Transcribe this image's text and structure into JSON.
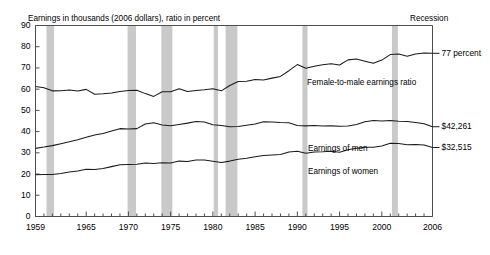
{
  "chart_data": {
    "type": "line",
    "title": "Earnings in thousands (2006 dollars), ratio in percent",
    "xlabel": "",
    "ylabel": "",
    "ylim": [
      0,
      90
    ],
    "xlim": [
      1959,
      2006
    ],
    "ytick_step": 10,
    "yticks": [
      "0",
      "10",
      "20",
      "30",
      "40",
      "50",
      "60",
      "70",
      "80",
      "90"
    ],
    "xticks": [
      "1959",
      "1965",
      "1970",
      "1975",
      "1980",
      "1985",
      "1990",
      "1995",
      "2000",
      "2006"
    ],
    "xtick_values": [
      1959,
      1965,
      1970,
      1975,
      1980,
      1985,
      1990,
      1995,
      2000,
      2006
    ],
    "grid": false,
    "legend_position": "inline-annotations",
    "x": [
      1959,
      1960,
      1961,
      1962,
      1963,
      1964,
      1965,
      1966,
      1967,
      1968,
      1969,
      1970,
      1971,
      1972,
      1973,
      1974,
      1975,
      1976,
      1977,
      1978,
      1979,
      1980,
      1981,
      1982,
      1983,
      1984,
      1985,
      1986,
      1987,
      1988,
      1989,
      1990,
      1991,
      1992,
      1993,
      1994,
      1995,
      1996,
      1997,
      1998,
      1999,
      2000,
      2001,
      2002,
      2003,
      2004,
      2005,
      2006
    ],
    "series": [
      {
        "name": "Female-to-male earnings ratio",
        "unit": "percent",
        "end_label": "77 percent",
        "end_value": 77,
        "values": [
          61.3,
          60.7,
          59.2,
          59.3,
          59.6,
          59.1,
          59.9,
          57.6,
          57.8,
          58.2,
          58.9,
          59.4,
          59.5,
          57.9,
          56.6,
          58.8,
          58.8,
          60.2,
          58.9,
          59.4,
          59.7,
          60.2,
          59.2,
          61.7,
          63.6,
          63.7,
          64.6,
          64.3,
          65.2,
          66.0,
          68.7,
          71.6,
          69.9,
          70.8,
          71.5,
          72.0,
          71.4,
          73.8,
          74.2,
          73.2,
          72.2,
          73.7,
          76.3,
          76.6,
          75.5,
          76.6,
          77.0,
          76.9
        ]
      },
      {
        "name": "Earnings of men",
        "unit": "thousands of 2006 dollars",
        "end_label": "$42,261",
        "end_value": 42.261,
        "values": [
          32.1,
          32.7,
          33.4,
          34.3,
          35.2,
          36.2,
          37.3,
          38.4,
          39.1,
          40.3,
          41.4,
          41.2,
          41.4,
          43.6,
          44.2,
          43.1,
          42.8,
          43.4,
          44.0,
          44.8,
          44.5,
          43.2,
          42.9,
          42.3,
          42.4,
          43.0,
          43.6,
          44.6,
          44.5,
          44.3,
          44.2,
          42.9,
          42.7,
          42.9,
          42.6,
          42.7,
          42.5,
          42.6,
          43.4,
          44.6,
          45.2,
          45.0,
          45.2,
          44.9,
          44.8,
          44.3,
          43.7,
          42.3
        ]
      },
      {
        "name": "Earnings of women",
        "unit": "thousands of 2006 dollars",
        "end_label": "$32,515",
        "end_value": 32.515,
        "values": [
          19.7,
          19.8,
          19.8,
          20.3,
          21.0,
          21.4,
          22.3,
          22.1,
          22.6,
          23.5,
          24.4,
          24.5,
          24.6,
          25.2,
          25.0,
          25.3,
          25.2,
          26.1,
          25.9,
          26.6,
          26.6,
          26.0,
          25.4,
          26.1,
          27.0,
          27.4,
          28.2,
          28.7,
          29.0,
          29.2,
          30.4,
          30.7,
          29.8,
          30.4,
          30.5,
          30.7,
          30.3,
          31.4,
          32.2,
          32.6,
          32.6,
          33.2,
          34.5,
          34.4,
          33.8,
          33.9,
          33.7,
          32.5
        ]
      }
    ],
    "recessions": [
      {
        "start": 1960.3,
        "end": 1961.2
      },
      {
        "start": 1969.9,
        "end": 1970.9
      },
      {
        "start": 1973.9,
        "end": 1975.2
      },
      {
        "start": 1980.1,
        "end": 1980.6
      },
      {
        "start": 1981.5,
        "end": 1982.9
      },
      {
        "start": 1990.6,
        "end": 1991.2
      },
      {
        "start": 2001.2,
        "end": 2001.9
      }
    ],
    "recession_legend": "Recession",
    "recession_color": "#c9c9c9",
    "line_color": "#1a1a1a",
    "axis_color": "#4d4d4d",
    "background": "#ffffff"
  }
}
